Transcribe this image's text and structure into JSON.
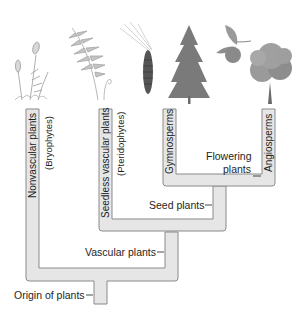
{
  "diagram": {
    "type": "cladogram",
    "colors": {
      "branch_fill": "#e6e6e6",
      "branch_stroke": "#8a8a8a",
      "text": "#1e1e1e",
      "background": "#ffffff"
    },
    "illustrations": [
      {
        "name": "moss",
        "icon": "moss-icon"
      },
      {
        "name": "fern",
        "icon": "fern-icon"
      },
      {
        "name": "pine branch with cone",
        "icon": "pine-cone-icon"
      },
      {
        "name": "conifer tree",
        "icon": "conifer-tree-icon"
      },
      {
        "name": "fruit with leaves",
        "icon": "fruit-icon"
      },
      {
        "name": "deciduous tree",
        "icon": "deciduous-tree-icon"
      }
    ],
    "tips": [
      {
        "label": "Nonvascular plants",
        "sublabel": "(Bryophytes)"
      },
      {
        "label": "Seedless vascular plants",
        "sublabel": "(Pteridophytes)"
      },
      {
        "label": "Gymnosperms"
      },
      {
        "label": "Angiosperms"
      }
    ],
    "nodes": {
      "flowering": {
        "line1": "Flowering",
        "line2": "plants"
      },
      "seed": "Seed plants",
      "vascular": "Vascular plants",
      "origin": "Origin of plants"
    }
  }
}
